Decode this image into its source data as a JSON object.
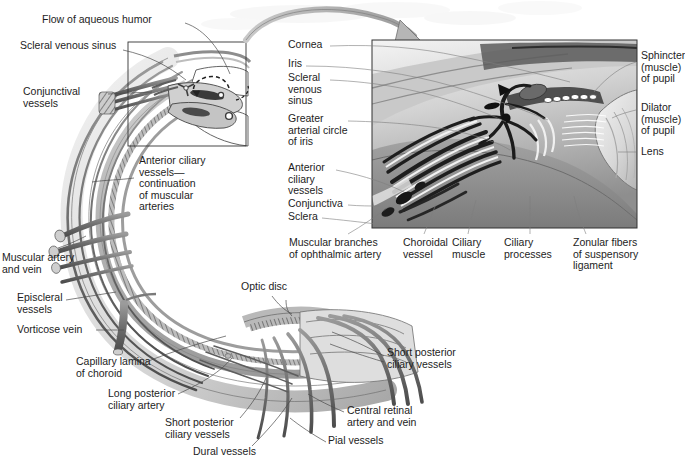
{
  "figure": {
    "domain": "anatomical-illustration",
    "ink_color": "#1d1d1d",
    "leader_color": "#4a4a4a",
    "arrow_color": "#9a9a9a",
    "inset_border_color": "#333333"
  },
  "left_diagram": {
    "name": "sagittal-section-of-eyeball",
    "callout_box": {
      "x": 128,
      "y": 42,
      "w": 118,
      "h": 104
    },
    "labels": [
      {
        "id": "flow-of-aqueous-humor",
        "text": "Flow of aqueous humor",
        "x": 42,
        "y": 20,
        "align": "left"
      },
      {
        "id": "scleral-venous-sinus",
        "text": "Scleral venous sinus",
        "x": 20,
        "y": 46,
        "align": "left"
      },
      {
        "id": "conjunctival-vessels",
        "text": "Conjunctival\nvessels",
        "x": 23,
        "y": 90,
        "align": "left"
      },
      {
        "id": "anterior-ciliary-vessels",
        "text": "Anterior ciliary\nvessels—\ncontinuation\nof muscular\narteries",
        "x": 138,
        "y": 158,
        "align": "left"
      },
      {
        "id": "muscular-artery-and-vein",
        "text": "Muscular artery\nand vein",
        "x": 2,
        "y": 256,
        "align": "left"
      },
      {
        "id": "episcleral-vessels",
        "text": "Episcleral\nvessels",
        "x": 17,
        "y": 296,
        "align": "left"
      },
      {
        "id": "vorticose-vein",
        "text": "Vorticose vein",
        "x": 17,
        "y": 326,
        "align": "left"
      },
      {
        "id": "capillary-lamina-of-choroid",
        "text": "Capillary lamina\nof choroid",
        "x": 76,
        "y": 360,
        "align": "left"
      },
      {
        "id": "long-posterior-ciliary-artery",
        "text": "Long posterior\nciliary artery",
        "x": 108,
        "y": 392,
        "align": "left"
      },
      {
        "id": "short-posterior-ciliary-vessels-left",
        "text": "Short posterior\nciliary vessels",
        "x": 165,
        "y": 420,
        "align": "left"
      },
      {
        "id": "dural-vessels",
        "text": "Dural vessels",
        "x": 193,
        "y": 448,
        "align": "left"
      },
      {
        "id": "optic-disc",
        "text": "Optic disc",
        "x": 241,
        "y": 284,
        "align": "left"
      },
      {
        "id": "short-posterior-ciliary-vessels-right",
        "text": "Short posterior\nciliary vessels",
        "x": 387,
        "y": 350,
        "align": "left"
      },
      {
        "id": "central-retinal-artery-and-vein",
        "text": "Central retinal\nartery and vein",
        "x": 347,
        "y": 408,
        "align": "left"
      },
      {
        "id": "pial-vessels",
        "text": "Pial vessels",
        "x": 328,
        "y": 438,
        "align": "left"
      }
    ]
  },
  "inset": {
    "name": "magnified-iridocorneal-angle",
    "frame": {
      "x": 372,
      "y": 40,
      "w": 265,
      "h": 188
    },
    "zoom_arrow": {
      "from": [
        248,
        34
      ],
      "to": [
        410,
        44
      ],
      "color": "#9a9a9a"
    },
    "labels_left": [
      {
        "id": "cornea",
        "text": "Cornea",
        "x": 288,
        "y": 42
      },
      {
        "id": "iris",
        "text": "Iris",
        "x": 288,
        "y": 62
      },
      {
        "id": "scleral-venous-sinus-inset",
        "text": "Scleral\nvenous\nsinus",
        "x": 288,
        "y": 76
      },
      {
        "id": "greater-arterial-circle-of-iris",
        "text": "Greater\narterial circle\nof iris",
        "x": 288,
        "y": 117
      },
      {
        "id": "anterior-ciliary-vessels-inset",
        "text": "Anterior\nciliary\nvessels",
        "x": 288,
        "y": 166
      },
      {
        "id": "conjunctiva",
        "text": "Conjunctiva",
        "x": 288,
        "y": 201
      },
      {
        "id": "sclera",
        "text": "Sclera",
        "x": 288,
        "y": 214
      }
    ],
    "labels_right": [
      {
        "id": "sphincter-muscle-of-pupil",
        "text": "Sphincter\n(muscle)\nof pupil",
        "x": 640,
        "y": 54
      },
      {
        "id": "dilator-muscle-of-pupil",
        "text": "Dilator\n(muscle)\nof pupil",
        "x": 640,
        "y": 106
      },
      {
        "id": "lens",
        "text": "Lens",
        "x": 640,
        "y": 149
      }
    ],
    "labels_bottom": [
      {
        "id": "muscular-branches-of-ophthalmic-artery",
        "text": "Muscular branches\nof ophthalmic artery",
        "x": 290,
        "y": 240
      },
      {
        "id": "choroidal-vessel",
        "text": "Choroidal\nvessel",
        "x": 403,
        "y": 240
      },
      {
        "id": "ciliary-muscle",
        "text": "Ciliary\nmuscle",
        "x": 452,
        "y": 240
      },
      {
        "id": "ciliary-processes",
        "text": "Ciliary\nprocesses",
        "x": 508,
        "y": 240
      },
      {
        "id": "zonular-fibers-of-suspensory-ligament",
        "text": "Zonular fibers\nof suspensory\nligament",
        "x": 573,
        "y": 240
      }
    ]
  },
  "caption": {
    "text": ""
  }
}
